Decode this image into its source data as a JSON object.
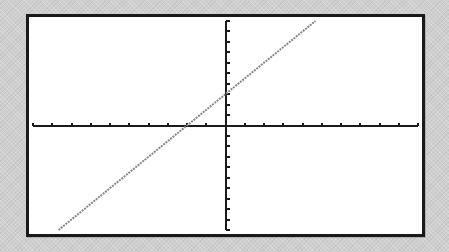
{
  "chart_data": {
    "type": "line",
    "title": "",
    "xlabel": "",
    "ylabel": "",
    "xlim": [
      -10,
      10
    ],
    "ylim": [
      -10,
      10
    ],
    "xscale_ticks": 1,
    "yscale_ticks": 1,
    "grid": false,
    "legend": null,
    "x_ticks": [
      -10,
      -9,
      -8,
      -7,
      -6,
      -5,
      -4,
      -3,
      -2,
      -1,
      0,
      1,
      2,
      3,
      4,
      5,
      6,
      7,
      8,
      9,
      10
    ],
    "y_ticks": [
      -10,
      -9,
      -8,
      -7,
      -6,
      -5,
      -4,
      -3,
      -2,
      -1,
      0,
      1,
      2,
      3,
      4,
      5,
      6,
      7,
      8,
      9,
      10
    ],
    "series": [
      {
        "name": "Y1",
        "equation": "y = 1.5x + 3",
        "slope": 1.5,
        "intercept": 3,
        "x": [
          -8.67,
          -2,
          0,
          4.67
        ],
        "y": [
          -10,
          0,
          3,
          10
        ],
        "color": "#888888"
      }
    ]
  },
  "colors": {
    "frame": "#1a1a1a",
    "screen": "#ffffff",
    "axis": "#1a1a1a",
    "plot_line": "#888888",
    "bezel": "#cfcfcf"
  },
  "labels": {
    "screen": "Graphing calculator screen",
    "function": "Y1 = 1.5X + 3"
  }
}
